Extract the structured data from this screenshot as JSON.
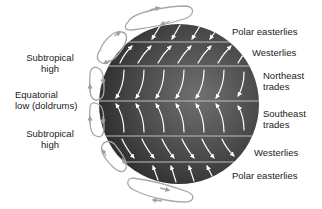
{
  "diagram": {
    "colors": {
      "globe_dark": "#2e2e2e",
      "globe_light": "#6a6a6a",
      "band_line": "#bdbdbd",
      "arrow": "#ffffff",
      "cell": "#a8a8a8",
      "text": "#222222"
    },
    "globe": {
      "cx": 179,
      "cy": 104,
      "r": 80
    },
    "band_lines_y": [
      42,
      66,
      101,
      136,
      162
    ],
    "left_labels": [
      {
        "id": "subtropical-high-north",
        "lines": [
          "Subtropical",
          "high"
        ]
      },
      {
        "id": "equatorial-low",
        "lines": [
          "Equatorial",
          "low (doldrums)"
        ]
      },
      {
        "id": "subtropical-high-south",
        "lines": [
          "Subtropical",
          "high"
        ]
      }
    ],
    "right_labels": [
      {
        "id": "polar-easterlies-north",
        "lines": [
          "Polar easterlies"
        ]
      },
      {
        "id": "westerlies-north",
        "lines": [
          "Westerlies"
        ]
      },
      {
        "id": "northeast-trades",
        "lines": [
          "Northeast",
          "trades"
        ]
      },
      {
        "id": "southeast-trades",
        "lines": [
          "Southeast",
          "trades"
        ]
      },
      {
        "id": "westerlies-south",
        "lines": [
          "Westerlies"
        ]
      },
      {
        "id": "polar-easterlies-south",
        "lines": [
          "Polar easterlies"
        ]
      }
    ],
    "wind_belts": [
      {
        "name": "Polar easterlies (N)",
        "direction": "southwest"
      },
      {
        "name": "Westerlies (N)",
        "direction": "northeast"
      },
      {
        "name": "Northeast trades",
        "direction": "southwest"
      },
      {
        "name": "Southeast trades",
        "direction": "northwest"
      },
      {
        "name": "Westerlies (S)",
        "direction": "southeast"
      },
      {
        "name": "Polar easterlies (S)",
        "direction": "northwest"
      }
    ],
    "circulation_cells": 6
  }
}
